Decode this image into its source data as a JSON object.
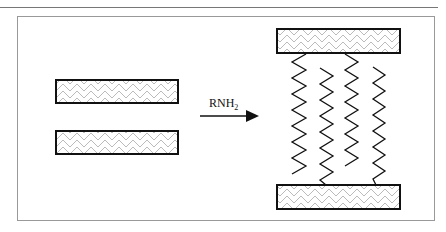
{
  "diagram": {
    "reagent_label": "RNH",
    "reagent_subscript": "2",
    "elements": [
      {
        "type": "layer",
        "role": "before-top-sheet"
      },
      {
        "type": "layer",
        "role": "before-bottom-sheet"
      },
      {
        "type": "arrow",
        "direction": "right"
      },
      {
        "type": "layer",
        "role": "after-top-sheet"
      },
      {
        "type": "layer",
        "role": "after-bottom-sheet"
      },
      {
        "type": "chains",
        "count": 4,
        "description": "zigzag alkyl chains intercalated between sheets"
      }
    ]
  }
}
